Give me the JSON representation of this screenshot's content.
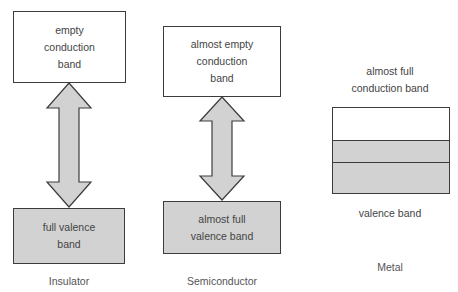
{
  "diagram": {
    "colors": {
      "empty_band": "#ffffff",
      "filled_band": "#d2d2d2",
      "border": "#3c3c3c",
      "arrow_fill": "#d2d2d2"
    },
    "insulator": {
      "conduction_band": "empty conduction band",
      "conduction_lines": [
        "empty",
        "conduction",
        "band"
      ],
      "valence_band": "full valence band",
      "valence_lines": [
        "full valence",
        "band"
      ],
      "caption": "Insulator"
    },
    "semiconductor": {
      "conduction_band": "almost empty conduction band",
      "conduction_lines": [
        "almost empty",
        "conduction",
        "band"
      ],
      "valence_band": "almost full valence band",
      "valence_lines": [
        "almost full",
        "valence band"
      ],
      "caption": "Semiconductor"
    },
    "metal": {
      "conduction_lines": [
        "almost full",
        "conduction band"
      ],
      "valence_label": "valence band",
      "caption": "Metal"
    }
  }
}
